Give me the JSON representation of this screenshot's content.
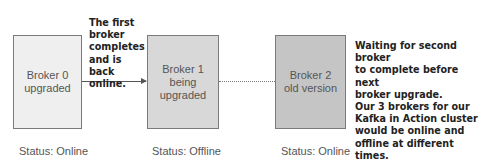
{
  "diagram": {
    "brokers": [
      {
        "label": "Broker 0\nupgraded",
        "status": "Status: Online",
        "fill": "#efefef"
      },
      {
        "label": "Broker 1\nbeing\nupgraded",
        "status": "Status: Offline",
        "fill": "#d8d8d8"
      },
      {
        "label": "Broker 2\nold version",
        "status": "Status: Online",
        "fill": "#c5c5c5"
      }
    ],
    "annotations": {
      "first_broker_note": "The first\nbroker\ncompletes\nand is back\nonline.",
      "waiting_note": "Waiting for second broker\nto complete before next\nbroker upgrade.\nOur 3 brokers for our\nKafka in Action cluster\nwould be online and\noffline at different times."
    },
    "connectors": [
      {
        "from": "Broker 0",
        "to": "Broker 1",
        "style": "solid-arrow"
      },
      {
        "from": "Broker 1",
        "to": "Broker 2",
        "style": "dotted"
      }
    ]
  }
}
